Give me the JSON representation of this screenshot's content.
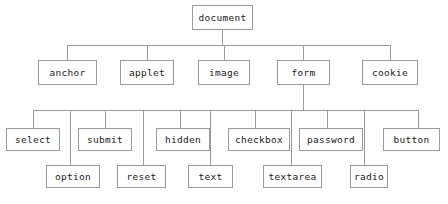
{
  "diagram": {
    "type": "tree",
    "colors": {
      "line": "#9a9a9a",
      "box_border": "#9a9a9a",
      "box_fill": "#ffffff",
      "text": "#1a1a1a",
      "caption_text": "#b9b9b9"
    },
    "caption": {
      "text": "",
      "visible": false
    },
    "levels": [
      {
        "level": 1,
        "name": "root",
        "nodes": [
          {
            "id": "document",
            "label": "document",
            "x": 192,
            "y": 5,
            "w": 61,
            "h": 25
          }
        ]
      },
      {
        "level": 2,
        "name": "document-children",
        "nodes": [
          {
            "id": "anchor",
            "label": "anchor",
            "x": 38,
            "y": 60,
            "w": 59,
            "h": 25
          },
          {
            "id": "applet",
            "label": "applet",
            "x": 120,
            "y": 60,
            "w": 54,
            "h": 25
          },
          {
            "id": "image",
            "label": "image",
            "x": 198,
            "y": 60,
            "w": 52,
            "h": 25
          },
          {
            "id": "form",
            "label": "form",
            "x": 277,
            "y": 60,
            "w": 53,
            "h": 25
          },
          {
            "id": "cookie",
            "label": "cookie",
            "x": 362,
            "y": 60,
            "w": 56,
            "h": 25
          }
        ]
      },
      {
        "level": 3,
        "name": "form-children-upper",
        "nodes": [
          {
            "id": "select",
            "label": "select",
            "x": 6,
            "y": 128,
            "w": 54,
            "h": 23
          },
          {
            "id": "submit",
            "label": "submit",
            "x": 78,
            "y": 128,
            "w": 54,
            "h": 23
          },
          {
            "id": "hidden",
            "label": "hidden",
            "x": 156,
            "y": 128,
            "w": 54,
            "h": 23
          },
          {
            "id": "checkbox",
            "label": "checkbox",
            "x": 228,
            "y": 128,
            "w": 62,
            "h": 23
          },
          {
            "id": "password",
            "label": "password",
            "x": 299,
            "y": 128,
            "w": 64,
            "h": 23
          },
          {
            "id": "button",
            "label": "button",
            "x": 383,
            "y": 128,
            "w": 57,
            "h": 23
          }
        ]
      },
      {
        "level": 4,
        "name": "form-children-lower",
        "nodes": [
          {
            "id": "option",
            "label": "option",
            "x": 46,
            "y": 165,
            "w": 54,
            "h": 23
          },
          {
            "id": "reset",
            "label": "reset",
            "x": 117,
            "y": 165,
            "w": 49,
            "h": 23
          },
          {
            "id": "text",
            "label": "text",
            "x": 188,
            "y": 165,
            "w": 45,
            "h": 23
          },
          {
            "id": "textarea",
            "label": "textarea",
            "x": 263,
            "y": 165,
            "w": 59,
            "h": 23
          },
          {
            "id": "radio",
            "label": "radio",
            "x": 350,
            "y": 165,
            "w": 38,
            "h": 23
          }
        ]
      }
    ],
    "edges": {
      "root_stem": {
        "x": 222,
        "y": 30,
        "h": 15
      },
      "bus_level2": {
        "x": 67,
        "y": 45,
        "w": 323
      },
      "level2_drops": [
        {
          "x": 67,
          "y": 45,
          "h": 15
        },
        {
          "x": 147,
          "y": 45,
          "h": 15
        },
        {
          "x": 224,
          "y": 45,
          "h": 15
        },
        {
          "x": 303,
          "y": 45,
          "h": 15
        },
        {
          "x": 390,
          "y": 45,
          "h": 15
        }
      ],
      "form_stem": {
        "x": 303,
        "y": 85,
        "h": 25
      },
      "bus_level3": {
        "x": 33,
        "y": 110,
        "w": 385
      },
      "level3_drops": [
        {
          "x": 33,
          "y": 110,
          "h": 18
        },
        {
          "x": 105,
          "y": 110,
          "h": 18
        },
        {
          "x": 180,
          "y": 110,
          "h": 18
        },
        {
          "x": 255,
          "y": 110,
          "h": 18
        },
        {
          "x": 327,
          "y": 110,
          "h": 18
        },
        {
          "x": 418,
          "y": 110,
          "h": 18
        }
      ],
      "level4_drops": [
        {
          "x": 70,
          "y": 110,
          "h": 55
        },
        {
          "x": 143,
          "y": 110,
          "h": 55
        },
        {
          "x": 210,
          "y": 110,
          "h": 55
        },
        {
          "x": 291,
          "y": 110,
          "h": 55
        },
        {
          "x": 364,
          "y": 110,
          "h": 55
        }
      ]
    }
  }
}
